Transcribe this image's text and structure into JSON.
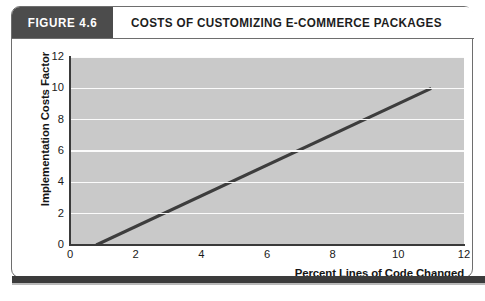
{
  "figure": {
    "number_label": "FIGURE 4.6",
    "title": "COSTS OF CUSTOMIZING E-COMMERCE PACKAGES"
  },
  "colors": {
    "header_box": "#4c4c4c",
    "plot_background": "#c9c9c9",
    "gridline": "#fbfbfb",
    "series_line": "#3d3d3d",
    "axis": "#3a3a3a",
    "frame": "#6e6e6e",
    "bottom_rule": "#3b3b3b"
  },
  "chart_data": {
    "type": "line",
    "title": "COSTS OF CUSTOMIZING E-COMMERCE PACKAGES",
    "xlabel": "Percent Lines of Code Changed",
    "ylabel": "Implementation Costs Factor",
    "xlim": [
      0,
      12
    ],
    "ylim": [
      0,
      12
    ],
    "xticks": [
      0,
      2,
      4,
      6,
      8,
      10,
      12
    ],
    "yticks": [
      0,
      2,
      4,
      6,
      8,
      10,
      12
    ],
    "xtick_labels": [
      "0",
      "2",
      "4",
      "6",
      "8",
      "10",
      "12"
    ],
    "ytick_labels": [
      "0",
      "2",
      "4",
      "6",
      "8",
      "10",
      "12"
    ],
    "grid": "horizontal",
    "legend": "none",
    "series": [
      {
        "name": "Implementation cost curve",
        "x": [
          0.8,
          11.0
        ],
        "y": [
          0.0,
          10.0
        ],
        "style": "solid",
        "linewidth": 3
      }
    ]
  }
}
